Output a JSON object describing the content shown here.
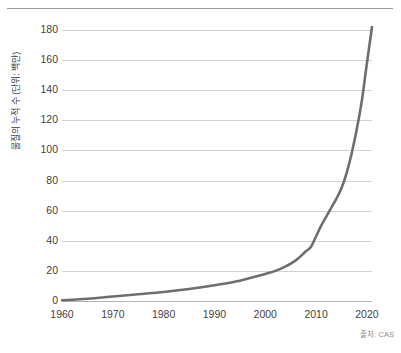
{
  "chart_data": {
    "type": "line",
    "title": "",
    "subtitle": "",
    "xlabel": "",
    "ylabel": "물질의 누적 수 (단위: 백만)",
    "source_note": "출처: CAS",
    "xlim": [
      1960,
      2021
    ],
    "ylim": [
      0,
      180
    ],
    "xticks": [
      "1960",
      "1970",
      "1980",
      "1990",
      "2000",
      "2010",
      "2020"
    ],
    "xtick_values": [
      1960,
      1970,
      1980,
      1990,
      2000,
      2010,
      2020
    ],
    "yticks": [
      "0",
      "20",
      "40",
      "60",
      "80",
      "100",
      "120",
      "140",
      "160",
      "180"
    ],
    "ytick_values": [
      0,
      20,
      40,
      60,
      80,
      100,
      120,
      140,
      160,
      180
    ],
    "grid": true,
    "grid_axis": "y",
    "legend": "none",
    "series": [
      {
        "name": "물질의 누적 수",
        "color": "#6e6e6e",
        "x": [
          1960,
          1965,
          1970,
          1975,
          1980,
          1985,
          1990,
          1995,
          2000,
          2002,
          2004,
          2006,
          2008,
          2009,
          2010,
          2011,
          2012,
          2013,
          2014,
          2015,
          2016,
          2017,
          2018,
          2019,
          2020,
          2021
        ],
        "values": [
          0.5,
          1.5,
          3,
          4.5,
          6,
          8,
          10.5,
          13.5,
          18,
          20,
          23,
          27,
          33,
          36,
          43,
          50,
          56,
          62,
          68,
          75,
          85,
          98,
          114,
          133,
          158,
          182
        ]
      }
    ],
    "annotations": [],
    "colors": {
      "line": "#6e6e6e",
      "gridline": "#d2d2d2",
      "baseline": "#b4b4b4",
      "top_rule": "#9a9a9a",
      "tick_text": "#3f3f3f",
      "source_text": "#8d8d8d",
      "background": "#ffffff"
    }
  }
}
